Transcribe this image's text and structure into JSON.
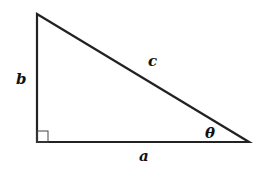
{
  "diagram": {
    "type": "right-triangle",
    "stroke_color": "#222222",
    "labels": {
      "side_vertical": "b",
      "side_horizontal": "a",
      "hypotenuse": "c",
      "angle": "θ"
    },
    "right_angle_marker": true
  }
}
